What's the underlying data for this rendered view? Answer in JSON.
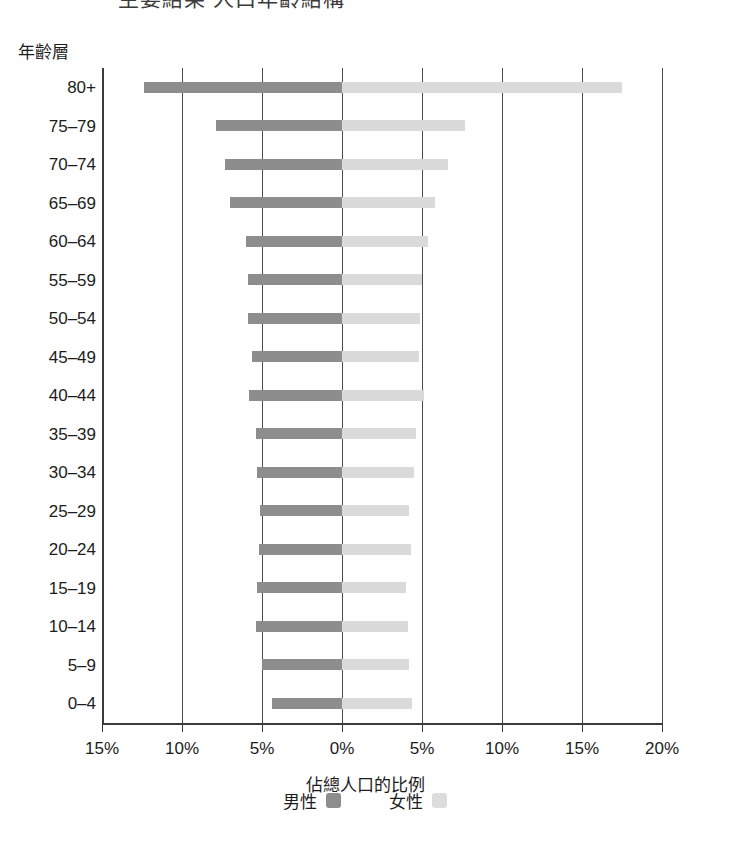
{
  "heading": {
    "clipped_text": "主要結果 人口年齡結構"
  },
  "axes": {
    "y_title": "年齡層",
    "x_title": "佔總人口的比例",
    "x_ticks": [
      "15%",
      "10%",
      "5%",
      "0%",
      "5%",
      "10%",
      "15%",
      "20%"
    ],
    "x_tick_values": [
      -15,
      -10,
      -5,
      0,
      5,
      10,
      15,
      20
    ],
    "x_min": -15,
    "x_max": 20
  },
  "legend": {
    "items": [
      {
        "label": "男性",
        "color": "#8d8d8d"
      },
      {
        "label": "女性",
        "color": "#dcdcdc"
      }
    ]
  },
  "colors": {
    "male": "#8d8d8d",
    "female": "#dadada",
    "axis": "#3b3b3b",
    "grid": "#4a4a4a",
    "text": "#1c1c1c"
  },
  "chart_data": {
    "type": "bar",
    "title": "主要結果 人口年齡結構",
    "subtype": "population-pyramid",
    "orientation": "horizontal-diverging",
    "xlabel": "佔總人口的比例",
    "ylabel": "年齡層",
    "xlim": [
      -15,
      20
    ],
    "x_unit": "percent",
    "grid": true,
    "legend_position": "bottom",
    "categories": [
      "80+",
      "75–79",
      "70–74",
      "65–69",
      "60–64",
      "55–59",
      "50–54",
      "45–49",
      "40–44",
      "35–39",
      "30–34",
      "25–29",
      "20–24",
      "15–19",
      "10–14",
      "5–9",
      "0–4"
    ],
    "series": [
      {
        "name": "男性",
        "color": "#8d8d8d",
        "direction": "left",
        "values": [
          12.4,
          7.9,
          7.3,
          7.0,
          6.0,
          5.9,
          5.9,
          5.6,
          5.8,
          5.4,
          5.3,
          5.1,
          5.2,
          5.3,
          5.4,
          5.0,
          4.4
        ]
      },
      {
        "name": "女性",
        "color": "#dadada",
        "direction": "right",
        "values": [
          17.5,
          7.7,
          6.6,
          5.8,
          5.4,
          5.0,
          4.9,
          4.8,
          5.1,
          4.6,
          4.5,
          4.2,
          4.3,
          4.0,
          4.1,
          4.2,
          4.4
        ]
      }
    ]
  }
}
